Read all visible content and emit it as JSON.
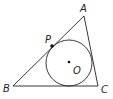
{
  "diagram": {
    "type": "geometry",
    "stroke_color": "#222222",
    "points": {
      "A": {
        "label": "A",
        "x": 84,
        "y": 16
      },
      "B": {
        "label": "B",
        "x": 13,
        "y": 86
      },
      "C": {
        "label": "C",
        "x": 98,
        "y": 86
      },
      "P": {
        "label": "P",
        "x": 52,
        "y": 46
      },
      "O": {
        "label": "O",
        "x": 69,
        "y": 62
      }
    },
    "circle": {
      "center": "O",
      "radius": 23
    },
    "labels": {
      "A": "A",
      "B": "B",
      "C": "C",
      "P": "P",
      "O": "O"
    }
  }
}
